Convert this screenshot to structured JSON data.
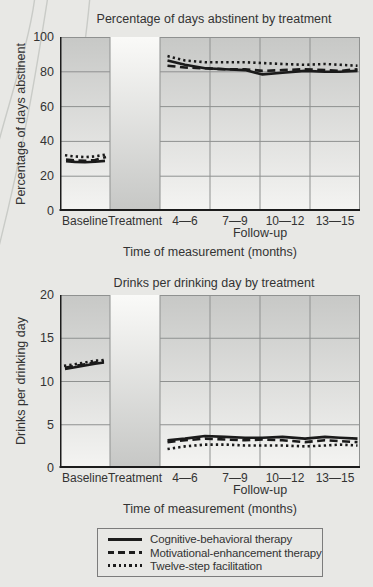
{
  "colors": {
    "background": "#e8e8e5",
    "plot_gradient_top": "#c7c8c6",
    "plot_gradient_bottom": "#f4f4f2",
    "treatment_gradient_top": "#fafaf8",
    "treatment_gradient_bottom": "#c6c7c5",
    "gridline": "#8f9190",
    "axis": "#1c1c1c",
    "line": "#1a1a1a",
    "text": "#333333",
    "decorative_arc": "#c9cbc7",
    "legend_border": "#7c7c7c"
  },
  "chart_data": [
    {
      "type": "line",
      "title": "Percentage of days abstinent by treatment",
      "ylabel": "Percentage of days abstinent",
      "xlabel": "Time of measurement (months)",
      "followup_label": "Follow-up",
      "ylim": [
        0,
        100
      ],
      "yticks": [
        0,
        20,
        40,
        60,
        80,
        100
      ],
      "categories": [
        "Baseline",
        "Treatment",
        "4—6",
        "7—9",
        "10—12",
        "13—15"
      ],
      "x_unit_note": "x in column units: 0-1 Baseline, 1-2 Treatment (no data), 2-6 Follow-up",
      "grid": true,
      "series": [
        {
          "name": "Cognitive-behavioral therapy",
          "style": "solid",
          "baseline": [
            [
              0.12,
              28.6
            ],
            [
              0.3,
              28.2
            ],
            [
              0.5,
              28.0
            ],
            [
              0.7,
              28.3
            ],
            [
              0.9,
              28.8
            ]
          ],
          "followup": [
            [
              2.15,
              86.5
            ],
            [
              2.5,
              84
            ],
            [
              2.9,
              82
            ],
            [
              3.3,
              81.5
            ],
            [
              3.7,
              81
            ],
            [
              4.05,
              78.5
            ],
            [
              4.45,
              79.5
            ],
            [
              4.9,
              80.5
            ],
            [
              5.3,
              80
            ],
            [
              5.6,
              80
            ],
            [
              5.95,
              80.5
            ]
          ]
        },
        {
          "name": "Motivational-enhancement therapy",
          "style": "dashed",
          "baseline": [
            [
              0.12,
              29.6
            ],
            [
              0.3,
              29.1
            ],
            [
              0.5,
              28.8
            ],
            [
              0.7,
              29.3
            ],
            [
              0.92,
              31.0
            ]
          ],
          "followup": [
            [
              2.15,
              83.5
            ],
            [
              2.5,
              82.5
            ],
            [
              2.9,
              82
            ],
            [
              3.3,
              81.5
            ],
            [
              3.7,
              81.5
            ],
            [
              4.05,
              80.5
            ],
            [
              4.45,
              81
            ],
            [
              4.9,
              81.5
            ],
            [
              5.3,
              81
            ],
            [
              5.6,
              80.5
            ],
            [
              5.95,
              81.5
            ]
          ]
        },
        {
          "name": "Twelve-step facilitation",
          "style": "dotted",
          "baseline": [
            [
              0.1,
              32.0
            ],
            [
              0.28,
              31.4
            ],
            [
              0.5,
              31.0
            ],
            [
              0.7,
              31.4
            ],
            [
              0.95,
              32.6
            ]
          ],
          "followup": [
            [
              2.15,
              89
            ],
            [
              2.5,
              86.5
            ],
            [
              2.9,
              85.5
            ],
            [
              3.3,
              85.5
            ],
            [
              3.7,
              85.5
            ],
            [
              4.05,
              85
            ],
            [
              4.45,
              84.5
            ],
            [
              4.9,
              84
            ],
            [
              5.3,
              84.5
            ],
            [
              5.6,
              84
            ],
            [
              5.95,
              83.5
            ]
          ]
        }
      ]
    },
    {
      "type": "line",
      "title": "Drinks per drinking day by treatment",
      "ylabel": "Drinks per drinking day",
      "xlabel": "Time of measurement (months)",
      "followup_label": "Follow-up",
      "ylim": [
        0,
        20
      ],
      "yticks": [
        0,
        5,
        10,
        15,
        20
      ],
      "categories": [
        "Baseline",
        "Treatment",
        "4—6",
        "7—9",
        "10—12",
        "13—15"
      ],
      "x_unit_note": "x in column units: 0-1 Baseline, 1-2 Treatment (no data), 2-6 Follow-up",
      "grid": true,
      "series": [
        {
          "name": "Cognitive-behavioral therapy",
          "style": "solid",
          "baseline": [
            [
              0.1,
              11.45
            ],
            [
              0.3,
              11.65
            ],
            [
              0.5,
              11.85
            ],
            [
              0.7,
              12.05
            ],
            [
              0.88,
              12.2
            ]
          ],
          "followup": [
            [
              2.15,
              3.2
            ],
            [
              2.5,
              3.4
            ],
            [
              2.9,
              3.7
            ],
            [
              3.3,
              3.6
            ],
            [
              3.7,
              3.5
            ],
            [
              4.05,
              3.5
            ],
            [
              4.45,
              3.6
            ],
            [
              4.9,
              3.4
            ],
            [
              5.3,
              3.6
            ],
            [
              5.6,
              3.5
            ],
            [
              5.95,
              3.4
            ]
          ]
        },
        {
          "name": "Motivational-enhancement therapy",
          "style": "dashed",
          "baseline": [
            [
              0.1,
              11.6
            ],
            [
              0.3,
              11.8
            ],
            [
              0.5,
              12.0
            ],
            [
              0.7,
              12.2
            ],
            [
              0.88,
              12.35
            ]
          ],
          "followup": [
            [
              2.15,
              3.0
            ],
            [
              2.5,
              3.2
            ],
            [
              2.9,
              3.4
            ],
            [
              3.3,
              3.3
            ],
            [
              3.7,
              3.2
            ],
            [
              4.05,
              3.3
            ],
            [
              4.45,
              3.2
            ],
            [
              4.9,
              3.0
            ],
            [
              5.3,
              3.2
            ],
            [
              5.6,
              3.1
            ],
            [
              5.95,
              3.0
            ]
          ]
        },
        {
          "name": "Twelve-step facilitation",
          "style": "dotted",
          "baseline": [
            [
              0.08,
              11.8
            ],
            [
              0.3,
              12.0
            ],
            [
              0.5,
              12.2
            ],
            [
              0.7,
              12.4
            ],
            [
              0.92,
              12.5
            ]
          ],
          "followup": [
            [
              2.15,
              2.2
            ],
            [
              2.5,
              2.5
            ],
            [
              2.9,
              2.7
            ],
            [
              3.3,
              2.7
            ],
            [
              3.7,
              2.6
            ],
            [
              4.05,
              2.6
            ],
            [
              4.45,
              2.6
            ],
            [
              4.9,
              2.5
            ],
            [
              5.3,
              2.6
            ],
            [
              5.6,
              2.7
            ],
            [
              5.95,
              2.6
            ]
          ]
        }
      ]
    }
  ],
  "legend": {
    "items": [
      {
        "label": "Cognitive-behavioral therapy",
        "style": "solid"
      },
      {
        "label": "Motivational-enhancement therapy",
        "style": "dashed"
      },
      {
        "label": "Twelve-step facilitation",
        "style": "dotted"
      }
    ]
  }
}
